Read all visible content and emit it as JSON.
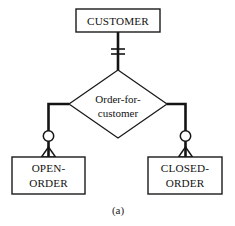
{
  "figure": {
    "caption": "(a)",
    "background_color": "#ffffff",
    "line_color": "#141414",
    "text_color": "#111111"
  },
  "entities": [
    {
      "id": "customer",
      "name": "CUSTOMER",
      "lines": [
        "CUSTOMER"
      ],
      "box": {
        "x": 76,
        "y": 9,
        "w": 84,
        "h": 23
      }
    },
    {
      "id": "open-order",
      "name": "OPEN-ORDER",
      "lines": [
        "OPEN-",
        "ORDER"
      ],
      "box": {
        "x": 12,
        "y": 157,
        "w": 73,
        "h": 37
      }
    },
    {
      "id": "closed-order",
      "name": "CLOSED-ORDER",
      "lines": [
        "CLOSED-",
        "ORDER"
      ],
      "box": {
        "x": 148,
        "y": 157,
        "w": 74,
        "h": 37
      }
    }
  ],
  "relationship": {
    "id": "order-for-customer",
    "name": "Order-for-customer",
    "lines": [
      "Order-for-",
      "customer"
    ],
    "diamond": {
      "cx": 118,
      "cy": 104,
      "rx": 49,
      "ry": 34
    }
  },
  "connections": [
    {
      "id": "customer-to-relationship",
      "from": "customer",
      "to": "order-for-customer",
      "cardinality": "one-mandatory",
      "notation": "double-tick"
    },
    {
      "id": "relationship-to-open-order",
      "from": "order-for-customer",
      "to": "open-order",
      "cardinality": "zero-or-many",
      "notation": "circle-crowfoot"
    },
    {
      "id": "relationship-to-closed-order",
      "from": "order-for-customer",
      "to": "closed-order",
      "cardinality": "zero-or-many",
      "notation": "circle-crowfoot"
    }
  ]
}
